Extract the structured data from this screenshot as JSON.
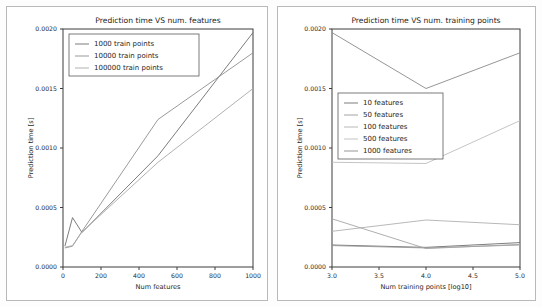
{
  "figure": {
    "background": "#fdfdfd",
    "panel_border": "#b9b9b9"
  },
  "chart_data": [
    {
      "id": "left",
      "type": "line",
      "title": "Prediction time VS num. features",
      "xlabel": "Num features",
      "ylabel": "Prediction time [s]",
      "xlim": [
        0,
        1000
      ],
      "ylim": [
        0,
        0.002
      ],
      "xticks": [
        0,
        200,
        400,
        600,
        800,
        1000
      ],
      "xticklabels": [
        "0",
        "200",
        "400",
        "600",
        "800",
        "1000"
      ],
      "yticks": [
        0,
        0.0005,
        0.001,
        0.0015,
        0.002
      ],
      "yticklabels": [
        "0.0000",
        "0.0005",
        "0.0010",
        "0.0015",
        "0.0020"
      ],
      "grid": false,
      "legend_position": "upper left",
      "x": [
        10,
        50,
        100,
        500,
        1000
      ],
      "series": [
        {
          "name": "1000 train points",
          "color": "#6e6e6e",
          "values": [
            0.000175,
            0.000415,
            0.00029,
            0.000935,
            0.00197
          ]
        },
        {
          "name": "10000 train points",
          "color": "#8f8f8f",
          "values": [
            0.00016,
            0.000175,
            0.0003,
            0.00124,
            0.0018
          ]
        },
        {
          "name": "100000 train points",
          "color": "#a8a8a8",
          "values": [
            0.000165,
            0.00018,
            0.000295,
            0.00088,
            0.0015
          ]
        }
      ]
    },
    {
      "id": "right",
      "type": "line",
      "title": "Prediction time VS num. training points",
      "xlabel": "Num training points [log10]",
      "ylabel": "Prediction time [s]",
      "xlim": [
        3.0,
        5.0
      ],
      "ylim": [
        0,
        0.002
      ],
      "xticks": [
        3.0,
        3.5,
        4.0,
        4.5,
        5.0
      ],
      "xticklabels": [
        "3.0",
        "3.5",
        "4.0",
        "4.5",
        "5.0"
      ],
      "yticks": [
        0,
        0.0005,
        0.001,
        0.0015,
        0.002
      ],
      "yticklabels": [
        "0.0000",
        "0.0005",
        "0.0010",
        "0.0015",
        "0.0020"
      ],
      "grid": false,
      "legend_position": "center left",
      "x": [
        3.0,
        4.0,
        5.0
      ],
      "series": [
        {
          "name": "10 features",
          "color": "#6e6e6e",
          "values": [
            0.000185,
            0.000165,
            0.000205
          ]
        },
        {
          "name": "50 features",
          "color": "#9a9a9a",
          "values": [
            0.00018,
            0.00016,
            0.000185
          ]
        },
        {
          "name": "100 features",
          "color": "#b0b0b0",
          "values": [
            0.0003,
            0.000395,
            0.000355
          ]
        },
        {
          "name": "500 features",
          "color": "#bdbdbd",
          "values": [
            0.00088,
            0.00087,
            0.00123
          ]
        },
        {
          "name": "1000 features",
          "color": "#8a8a8a",
          "values": [
            0.00197,
            0.0015,
            0.0018
          ]
        }
      ],
      "extra_series": [
        {
          "name": "declining-low-line",
          "color": "#a5a5a5",
          "x": [
            3.0,
            4.0,
            5.0
          ],
          "values": [
            0.000405,
            0.000155,
            0.00019
          ]
        }
      ]
    }
  ]
}
